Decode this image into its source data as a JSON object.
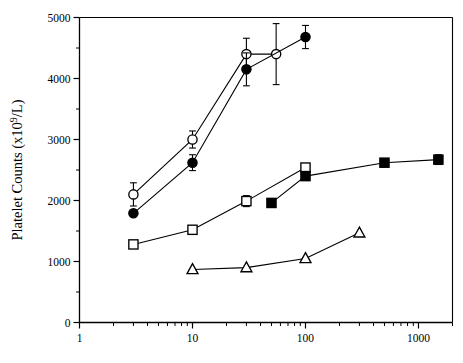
{
  "figure": {
    "name": "platelet-counts-dose-response",
    "ylabel": "Platelet Counts (x10",
    "ylabel_sup": "9",
    "ylabel_tail": "/L)"
  },
  "chart_data": {
    "type": "scatter",
    "title": "",
    "xlabel": "",
    "ylabel": "Platelet Counts (x10⁹/L)",
    "xscale": "log",
    "yscale": "linear",
    "xlim": [
      1,
      2000
    ],
    "ylim": [
      0,
      5000
    ],
    "grid": false,
    "legend": "none",
    "ytick_labels": [
      "0",
      "1000",
      "2000",
      "3000",
      "4000",
      "5000"
    ],
    "ytick_values": [
      0,
      1000,
      2000,
      3000,
      4000,
      5000
    ],
    "yminor_values": [
      500,
      1500,
      2500,
      3500,
      4500
    ],
    "xtick_labels": [
      "1",
      "10",
      "100",
      "1000"
    ],
    "xtick_values": [
      1,
      10,
      100,
      1000
    ],
    "series": [
      {
        "name": "open-circles",
        "marker": "circle-open",
        "color": "#000000",
        "fill": "#ffffff",
        "x": [
          3,
          10,
          30,
          55
        ],
        "values": [
          2100,
          3000,
          4400,
          4400
        ],
        "yerr": [
          190,
          140,
          260,
          500
        ]
      },
      {
        "name": "filled-circles",
        "marker": "circle-filled",
        "color": "#000000",
        "fill": "#000000",
        "x": [
          3,
          10,
          30,
          100
        ],
        "values": [
          1790,
          2620,
          4150,
          4680
        ],
        "yerr": [
          0,
          130,
          270,
          190
        ]
      },
      {
        "name": "open-squares",
        "marker": "square-open",
        "color": "#000000",
        "fill": "#ffffff",
        "x": [
          3,
          10,
          30,
          100
        ],
        "values": [
          1280,
          1520,
          1990,
          2540
        ],
        "yerr": [
          0,
          0,
          90,
          0
        ]
      },
      {
        "name": "filled-squares",
        "marker": "square-filled",
        "color": "#000000",
        "fill": "#000000",
        "x": [
          50,
          100,
          500,
          1500
        ],
        "values": [
          1960,
          2400,
          2620,
          2670
        ],
        "yerr": [
          0,
          0,
          0,
          80
        ]
      },
      {
        "name": "open-triangles",
        "marker": "triangle-open",
        "color": "#000000",
        "fill": "#ffffff",
        "x": [
          10,
          30,
          100,
          300
        ],
        "values": [
          870,
          900,
          1050,
          1470
        ],
        "yerr": [
          0,
          0,
          0,
          0
        ]
      }
    ]
  }
}
